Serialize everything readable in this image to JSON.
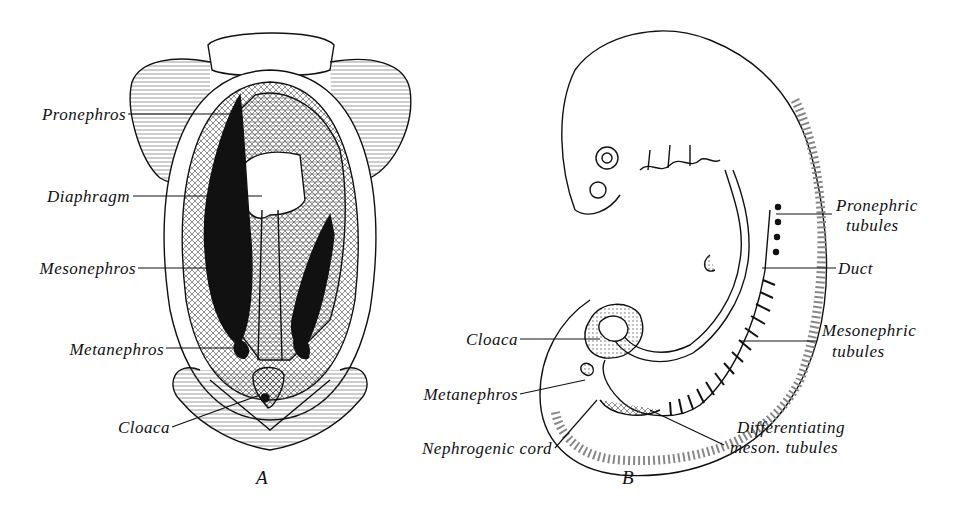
{
  "figure_a": {
    "caption": "A",
    "labels": {
      "pronephros": "Pronephros",
      "diaphragm": "Diaphragm",
      "mesonephros": "Mesonephros",
      "metanephros": "Metanephros",
      "cloaca": "Cloaca"
    }
  },
  "figure_b": {
    "caption": "B",
    "labels": {
      "pronephric_tubules_1": "Pronephric",
      "pronephric_tubules_2": "tubules",
      "duct": "Duct",
      "mesonephric_tubules_1": "Mesonephric",
      "mesonephric_tubules_2": "tubules",
      "cloaca": "Cloaca",
      "metanephros": "Metanephros",
      "nephrogenic_cord": "Nephrogenic cord",
      "differentiating_1": "Differentiating",
      "differentiating_2": "meson. tubules"
    }
  }
}
